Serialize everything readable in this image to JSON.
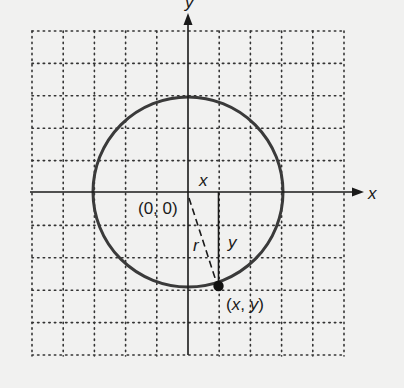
{
  "figure": {
    "type": "circle-on-coordinate-plane",
    "labels": {
      "y_axis": "y",
      "x_axis": "x",
      "origin": "(0, 0)",
      "horizontal_leg": "x",
      "vertical_leg": "y",
      "radius": "r",
      "point": "(x, y)"
    },
    "colors": {
      "background": "#f1f1f0",
      "ink": "#1a1a1a",
      "circle": "#3a3a3a",
      "grid": "#333333"
    },
    "grid": {
      "columns": 10,
      "rows": 10,
      "style": "dotted"
    },
    "circle": {
      "center": "(0, 0)",
      "radius_units": 3
    },
    "point_on_circle": {
      "approx_x_units": 1,
      "approx_y_units": -3
    }
  }
}
